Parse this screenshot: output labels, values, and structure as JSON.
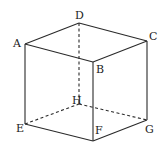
{
  "diagram": {
    "type": "cube",
    "title": "",
    "vertices": {
      "A": {
        "x": 25,
        "y": 44,
        "label": "A",
        "lx": 13,
        "ly": 47
      },
      "B": {
        "x": 93,
        "y": 62,
        "label": "B",
        "lx": 96,
        "ly": 73
      },
      "C": {
        "x": 147,
        "y": 41,
        "label": "C",
        "lx": 149,
        "ly": 40
      },
      "D": {
        "x": 79,
        "y": 23,
        "label": "D",
        "lx": 75,
        "ly": 19
      },
      "E": {
        "x": 25,
        "y": 124,
        "label": "E",
        "lx": 16,
        "ly": 132
      },
      "F": {
        "x": 93,
        "y": 141,
        "label": "F",
        "lx": 95,
        "ly": 134
      },
      "G": {
        "x": 147,
        "y": 120,
        "label": "G",
        "lx": 145,
        "ly": 133
      },
      "H": {
        "x": 79,
        "y": 104,
        "label": "H",
        "lx": 72,
        "ly": 104
      }
    },
    "edges_solid": [
      [
        "A",
        "D"
      ],
      [
        "D",
        "C"
      ],
      [
        "A",
        "B"
      ],
      [
        "B",
        "C"
      ],
      [
        "A",
        "E"
      ],
      [
        "B",
        "F"
      ],
      [
        "C",
        "G"
      ],
      [
        "E",
        "F"
      ],
      [
        "F",
        "G"
      ]
    ],
    "edges_dashed": [
      [
        "D",
        "H"
      ],
      [
        "E",
        "H"
      ],
      [
        "H",
        "G"
      ]
    ],
    "labels": [
      "A",
      "B",
      "C",
      "D",
      "E",
      "F",
      "G",
      "H"
    ],
    "colors": {
      "stroke": "#2a2a2a",
      "background": "#ffffff"
    }
  }
}
